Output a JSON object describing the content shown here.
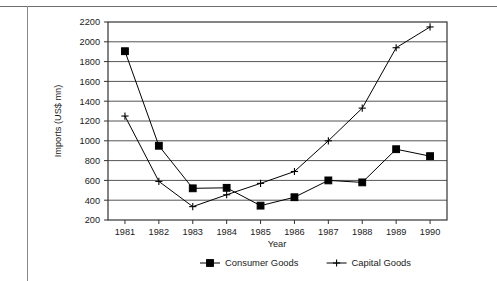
{
  "chart_data": {
    "type": "line",
    "title": "",
    "subtitle": "",
    "xlabel": "Year",
    "ylabel": "Imports (US$ mn)",
    "categories": [
      "1981",
      "1982",
      "1983",
      "1984",
      "1985",
      "1986",
      "1987",
      "1988",
      "1989",
      "1990"
    ],
    "x": [
      1981,
      1982,
      1983,
      1984,
      1985,
      1986,
      1987,
      1988,
      1989,
      1990
    ],
    "series": [
      {
        "name": "Consumer Goods",
        "marker": "filled-square",
        "color": "#000000",
        "values": [
          1905,
          950,
          520,
          525,
          345,
          430,
          600,
          580,
          915,
          845
        ]
      },
      {
        "name": "Capital Goods",
        "marker": "plus",
        "color": "#000000",
        "values": [
          1250,
          590,
          335,
          455,
          570,
          690,
          1000,
          1330,
          1940,
          2150
        ]
      }
    ],
    "ylim": [
      200,
      2200
    ],
    "yticks": [
      200,
      400,
      600,
      800,
      1000,
      1200,
      1400,
      1600,
      1800,
      2000,
      2200
    ],
    "ytick_labels": [
      "200",
      "400",
      "600",
      "800",
      "1000",
      "1200",
      "1400",
      "1600",
      "1800",
      "2000",
      "2200"
    ],
    "xtick_labels": [
      "1981",
      "1982",
      "1983",
      "1984",
      "1985",
      "1986",
      "1987",
      "1988",
      "1989",
      "1990"
    ],
    "grid": "horizontal",
    "grid_color": "#555555",
    "legend_position": "bottom-center",
    "legend": [
      "Consumer Goods",
      "Capital Goods"
    ],
    "plot_border_color": "#333333",
    "background_color": "#ffffff"
  }
}
